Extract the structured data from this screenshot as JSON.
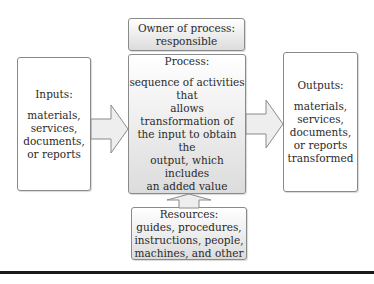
{
  "owner": {
    "lines": [
      "Owner of process:",
      "responsible"
    ]
  },
  "inputs": {
    "title": "Inputs:",
    "lines": [
      "materials,",
      "services,",
      "documents,",
      "or reports"
    ]
  },
  "process": {
    "title": "Process:",
    "lines": [
      "sequence of activities that",
      "allows transformation of",
      "the input to obtain the",
      "output, which includes",
      "an added value"
    ]
  },
  "outputs": {
    "title": "Outputs:",
    "lines": [
      "materials,",
      "services,",
      "documents,",
      "or reports",
      "transformed"
    ]
  },
  "resources": {
    "lines": [
      "Resources:",
      "guides, procedures,",
      "instructions, people,",
      "machines, and other"
    ]
  },
  "colors": {
    "arrow_fill": "#eeeeee",
    "arrow_stroke": "#8a8a8a",
    "border": "#8a8a8a"
  }
}
